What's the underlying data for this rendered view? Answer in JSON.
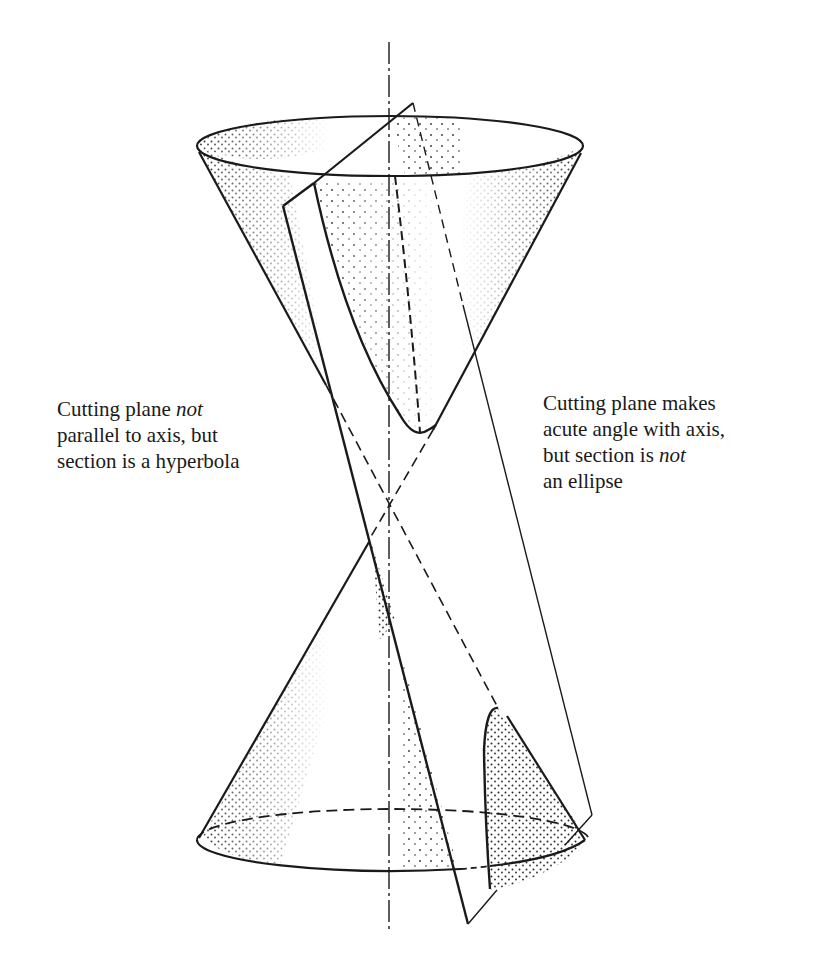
{
  "figure": {
    "colors": {
      "ink": "#1a1a1a",
      "background": "#ffffff",
      "stipple": "#2a2a2a"
    }
  },
  "captions": {
    "left": {
      "line1_pre": "Cutting plane ",
      "line1_em": "not",
      "line2": "parallel to axis, but",
      "line3": "section is a hyperbola"
    },
    "right": {
      "line1": "Cutting plane makes",
      "line2": "acute angle with axis,",
      "line3_pre": "but section is ",
      "line3_em": "not",
      "line4": "an ellipse"
    }
  },
  "geometry": {
    "axis": {
      "x": 389,
      "y_top": 42,
      "y_bottom": 933,
      "style": "dash-dot"
    },
    "apex": {
      "x": 389,
      "y": 500
    },
    "upper_nappe_rim": {
      "cx": 390,
      "cy": 146,
      "rx": 193,
      "ry": 30
    },
    "lower_nappe_base": {
      "cx": 393,
      "cy": 840,
      "rx": 196,
      "ry": 31
    },
    "cutting_plane_corners": [
      [
        283,
        206
      ],
      [
        413,
        103
      ],
      [
        592,
        815
      ],
      [
        468,
        924
      ]
    ],
    "hyperbola_upper_vertex": {
      "x": 419,
      "y": 436
    },
    "hyperbola_lower_vertex": {
      "x": 497,
      "y": 708
    }
  }
}
